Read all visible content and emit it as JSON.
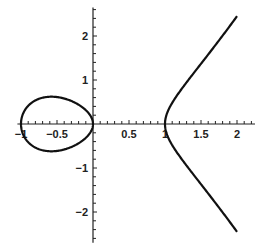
{
  "chart_data": {
    "type": "line",
    "title": "",
    "equation": "y^2 = x^3 - x",
    "xlabel": "",
    "ylabel": "",
    "xlim": [
      -1,
      2
    ],
    "ylim": [
      -2.5,
      2.5
    ],
    "grid": false,
    "legend": null,
    "x_ticks": [
      {
        "value": -1,
        "label": "-1"
      },
      {
        "value": -0.5,
        "label": "-0.5"
      },
      {
        "value": 0.5,
        "label": "0.5"
      },
      {
        "value": 1,
        "label": "1"
      },
      {
        "value": 1.5,
        "label": "1.5"
      },
      {
        "value": 2,
        "label": "2"
      }
    ],
    "y_ticks": [
      {
        "value": 2,
        "label": "2"
      },
      {
        "value": 1,
        "label": "1"
      },
      {
        "value": -1,
        "label": "-1"
      },
      {
        "value": -2,
        "label": "-2"
      }
    ],
    "minor_tick_step": 0.1,
    "series": [
      {
        "name": "oval component",
        "x_range": [
          -1,
          0
        ],
        "points": [
          [
            -1,
            0
          ],
          [
            -0.9,
            0.41
          ],
          [
            -0.8,
            0.54
          ],
          [
            -0.7,
            0.6
          ],
          [
            -0.577,
            0.62
          ],
          [
            -0.5,
            0.61
          ],
          [
            -0.4,
            0.58
          ],
          [
            -0.3,
            0.52
          ],
          [
            -0.2,
            0.44
          ],
          [
            -0.1,
            0.31
          ],
          [
            0,
            0
          ]
        ]
      },
      {
        "name": "unbounded component",
        "x_range": [
          1,
          2
        ],
        "points": [
          [
            1,
            0
          ],
          [
            1.1,
            0.48
          ],
          [
            1.25,
            0.84
          ],
          [
            1.5,
            1.37
          ],
          [
            1.75,
            1.93
          ],
          [
            2,
            2.45
          ]
        ]
      }
    ],
    "colors": {
      "curve": "#111111",
      "axes": "#222222",
      "background": "#ffffff"
    }
  },
  "layout": {
    "origin_px": [
      93,
      124
    ],
    "px_per_unit_x": 72,
    "px_per_unit_y": 44
  }
}
